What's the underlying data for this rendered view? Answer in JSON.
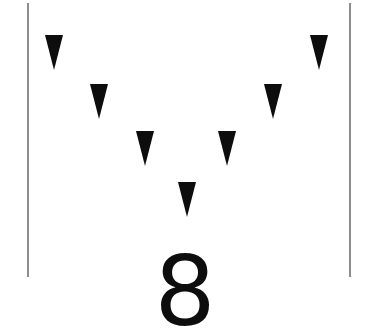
{
  "canvas": {
    "width": 370,
    "height": 336,
    "background_color": "#ffffff"
  },
  "rules": {
    "color": "#8d8d8d",
    "stroke_width": 1.5,
    "left": {
      "x": 27,
      "y_start": 3,
      "y_end": 277
    },
    "right": {
      "x": 349,
      "y_start": 3,
      "y_end": 277
    }
  },
  "markers": {
    "count": 7,
    "shape": "triangle-down",
    "color": "#0d0d0d",
    "width": 18,
    "height": 35,
    "arrangement": "v-chevron",
    "items": [
      {
        "label": "triangle-1",
        "x": 45,
        "y": 35
      },
      {
        "label": "triangle-2",
        "x": 90,
        "y": 84
      },
      {
        "label": "triangle-3",
        "x": 136,
        "y": 131
      },
      {
        "label": "triangle-4",
        "x": 178,
        "y": 182
      },
      {
        "label": "triangle-5",
        "x": 218,
        "y": 131
      },
      {
        "label": "triangle-6",
        "x": 264,
        "y": 84
      },
      {
        "label": "triangle-7",
        "x": 310,
        "y": 35
      }
    ]
  },
  "numeral": {
    "value": "8",
    "color": "#0d0d0d",
    "font_size": 96
  },
  "chart_data": {
    "type": "scatter",
    "title": "",
    "xlabel": "",
    "ylabel": "",
    "grid": false,
    "legend": null,
    "xlim": [
      27,
      349
    ],
    "ylim": [
      3,
      277
    ],
    "annotations": [
      "8"
    ],
    "series": [
      {
        "name": "triangle-down markers",
        "marker": "triangle-down",
        "color": "#0d0d0d",
        "x": [
          54,
          99,
          145,
          187,
          227,
          273,
          319
        ],
        "y": [
          35,
          84,
          131,
          182,
          131,
          84,
          35
        ]
      }
    ]
  }
}
